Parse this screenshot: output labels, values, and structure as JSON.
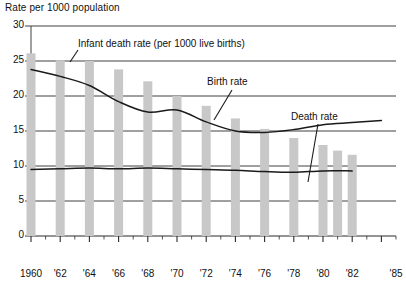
{
  "chart_data": {
    "type": "bar",
    "title": "Rate per 1000 population",
    "xlabel": "",
    "ylabel": "Rate per 1000 population",
    "ylim": [
      0,
      30
    ],
    "yticks": [
      0,
      5,
      10,
      15,
      20,
      25,
      30
    ],
    "xlim": [
      1960,
      1985
    ],
    "grid": true,
    "legend_position": "annotations-inline",
    "categories": [
      "1960",
      "'62",
      "'64",
      "'66",
      "'68",
      "'70",
      "'72",
      "'74",
      "'76",
      "'78",
      "'80",
      "'82",
      "'85"
    ],
    "xtick_labels": [
      "1960",
      "'62",
      "'64",
      "'66",
      "'68",
      "'70",
      "'72",
      "'74",
      "'76",
      "'78",
      "'80",
      "'82",
      "'85"
    ],
    "annotations": [
      {
        "name": "infant-death-rate-label",
        "text": "Infant death rate (per 1000 live births)"
      },
      {
        "name": "birth-rate-label",
        "text": "Birth rate"
      },
      {
        "name": "death-rate-label",
        "text": "Death rate"
      }
    ],
    "series": [
      {
        "name": "Infant death rate (per 1000 live births)",
        "type": "bar",
        "color": "#c8c8c8",
        "x": [
          1960,
          1962,
          1964,
          1966,
          1968,
          1970,
          1972,
          1974,
          1976,
          1978,
          1980,
          1981,
          1982
        ],
        "values": [
          26.1,
          25.1,
          25.0,
          23.8,
          22.1,
          20.0,
          18.6,
          16.8,
          15.3,
          14.0,
          13.0,
          12.2,
          11.6
        ]
      },
      {
        "name": "Birth rate",
        "type": "line",
        "color": "#1a1a1a",
        "x": [
          1960,
          1962,
          1964,
          1966,
          1968,
          1970,
          1972,
          1974,
          1976,
          1978,
          1980,
          1982,
          1984
        ],
        "values": [
          23.8,
          22.8,
          21.5,
          19.2,
          17.7,
          18.0,
          16.3,
          15.0,
          14.8,
          15.2,
          15.9,
          16.2,
          16.5
        ]
      },
      {
        "name": "Death rate",
        "type": "line",
        "color": "#1a1a1a",
        "x": [
          1960,
          1962,
          1964,
          1966,
          1968,
          1970,
          1972,
          1974,
          1976,
          1978,
          1980,
          1982
        ],
        "values": [
          9.5,
          9.6,
          9.7,
          9.6,
          9.7,
          9.6,
          9.5,
          9.4,
          9.2,
          9.1,
          9.3,
          9.3
        ]
      }
    ]
  },
  "axis": {
    "y_title": "Rate per 1000 population"
  },
  "colors": {
    "bar": "#c8c8c8",
    "line": "#1a1a1a",
    "grid": "#2b2b2b",
    "text": "#111111",
    "background": "#ffffff"
  }
}
